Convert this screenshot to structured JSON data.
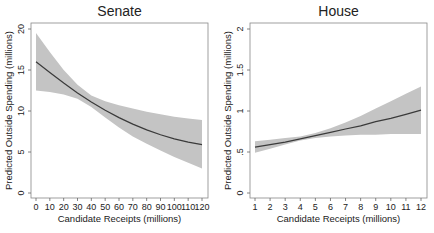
{
  "chart_data": [
    {
      "type": "line",
      "title": "Senate",
      "xlabel": "Candidate Receipts (millions)",
      "ylabel": "Predicted Outside Spending (millions)",
      "xlim": [
        0,
        120
      ],
      "ylim": [
        0,
        20
      ],
      "xticks": [
        0,
        10,
        20,
        30,
        40,
        50,
        60,
        70,
        80,
        90,
        100,
        110,
        120
      ],
      "yticks": [
        0,
        5,
        10,
        15,
        20
      ],
      "grid": false,
      "series": [
        {
          "name": "Predicted",
          "x": [
            0,
            10,
            20,
            30,
            40,
            50,
            60,
            70,
            80,
            90,
            100,
            110,
            120
          ],
          "values": [
            16.0,
            14.7,
            13.4,
            12.2,
            11.1,
            10.1,
            9.2,
            8.4,
            7.7,
            7.1,
            6.6,
            6.2,
            5.9
          ]
        },
        {
          "name": "CI lower",
          "x": [
            0,
            10,
            20,
            30,
            40,
            50,
            60,
            70,
            80,
            90,
            100,
            110,
            120
          ],
          "values": [
            12.5,
            12.3,
            12.0,
            11.5,
            10.5,
            9.2,
            8.0,
            6.9,
            6.0,
            5.2,
            4.4,
            3.7,
            3.0
          ]
        },
        {
          "name": "CI upper",
          "x": [
            0,
            10,
            20,
            30,
            40,
            50,
            60,
            70,
            80,
            90,
            100,
            110,
            120
          ],
          "values": [
            19.5,
            17.2,
            15.0,
            13.2,
            11.9,
            11.2,
            10.7,
            10.3,
            9.9,
            9.6,
            9.3,
            9.1,
            8.9
          ]
        }
      ]
    },
    {
      "type": "line",
      "title": "House",
      "xlabel": "Candidate Receipts (millions)",
      "ylabel": "Predicted Outside Spending (millions)",
      "xlim": [
        1,
        12
      ],
      "ylim": [
        0,
        2
      ],
      "xticks": [
        1,
        2,
        3,
        4,
        5,
        6,
        7,
        8,
        9,
        10,
        11,
        12
      ],
      "yticks": [
        0,
        0.5,
        1,
        1.5,
        2
      ],
      "ytick_labels": [
        "0",
        ".5",
        "1",
        "1.5",
        "2"
      ],
      "grid": false,
      "series": [
        {
          "name": "Predicted",
          "x": [
            1,
            2,
            3,
            4,
            5,
            6,
            7,
            8,
            9,
            10,
            11,
            12
          ],
          "values": [
            0.56,
            0.59,
            0.62,
            0.66,
            0.7,
            0.74,
            0.78,
            0.82,
            0.87,
            0.91,
            0.96,
            1.01
          ]
        },
        {
          "name": "CI lower",
          "x": [
            1,
            2,
            3,
            4,
            5,
            6,
            7,
            8,
            9,
            10,
            11,
            12
          ],
          "values": [
            0.49,
            0.54,
            0.59,
            0.64,
            0.67,
            0.69,
            0.7,
            0.71,
            0.71,
            0.72,
            0.72,
            0.72
          ]
        },
        {
          "name": "CI upper",
          "x": [
            1,
            2,
            3,
            4,
            5,
            6,
            7,
            8,
            9,
            10,
            11,
            12
          ],
          "values": [
            0.63,
            0.65,
            0.67,
            0.69,
            0.73,
            0.79,
            0.86,
            0.94,
            1.03,
            1.12,
            1.21,
            1.3
          ]
        }
      ]
    }
  ]
}
